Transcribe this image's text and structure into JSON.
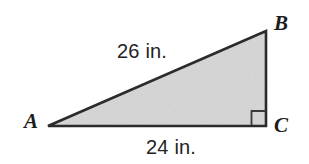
{
  "figure": {
    "type": "right-triangle-diagram",
    "width": 309,
    "height": 164,
    "background_color": "#ffffff",
    "fill_color": "#d6d6d6",
    "stroke_color": "#2b2b2b",
    "text_color": "#1c1c1c"
  },
  "vertices": {
    "a": {
      "label": "A",
      "x": 48,
      "y": 126
    },
    "b": {
      "label": "B",
      "x": 266,
      "y": 31
    },
    "c": {
      "label": "C",
      "x": 266,
      "y": 126
    }
  },
  "measurements": {
    "hypotenuse": {
      "label": "26 in.",
      "value": 26,
      "unit": "in.",
      "side": "AB"
    },
    "base": {
      "label": "24 in.",
      "value": 24,
      "unit": "in.",
      "side": "AC"
    }
  },
  "markers": {
    "right_angle": {
      "at_vertex": "C",
      "size": 14,
      "label": "right-angle-marker"
    }
  }
}
